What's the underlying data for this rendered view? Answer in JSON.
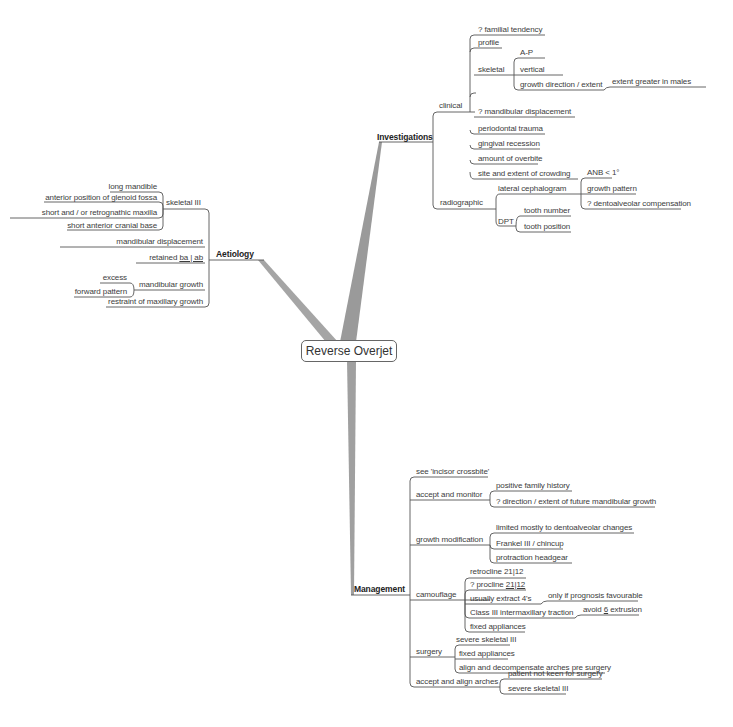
{
  "root": {
    "label": "Reverse Overjet"
  },
  "investigations": {
    "label": "Investigations",
    "clinical": {
      "label": "clinical",
      "items": [
        "? familial tendency",
        "profile",
        "skeletal",
        "? mandibular displacement",
        "periodontal trauma",
        "gingival recession",
        "amount of overbite",
        "site and extent of crowding"
      ],
      "skeletal": {
        "items": [
          "A-P",
          "vertical",
          "growth direction / extent"
        ],
        "growth_note": "extent greater in males"
      }
    },
    "radiographic": {
      "label": "radiographic",
      "lateral_ceph": {
        "label": "lateral cephalogram",
        "items": [
          "ANB < 1°",
          "growth pattern",
          "? dentoalveolar compensation"
        ]
      },
      "dpt": {
        "label": "DPT",
        "items": [
          "tooth number",
          "tooth position"
        ]
      }
    }
  },
  "aetiology": {
    "label": "Aetiology",
    "skeletal": {
      "label": "skeletal III",
      "items": [
        "long mandible",
        "anterior position of glenoid fossa",
        "short and / or retrognathic  maxilla",
        "short anterior cranial base"
      ]
    },
    "mandibular_displacement": "mandibular displacement",
    "retained": {
      "prefix": "retained ",
      "teeth": "ba | ab"
    },
    "mandibular_growth": {
      "label": "mandibular growth",
      "items": [
        "excess",
        "forward pattern"
      ]
    },
    "restraint": "restraint of  maxillary growth"
  },
  "management": {
    "label": "Management",
    "see_crossbite": "see 'incisor crossbite'",
    "accept_monitor": {
      "label": "accept and monitor",
      "items": [
        "positive family history",
        "? direction / extent of future mandibular growth"
      ]
    },
    "growth_mod": {
      "label": "growth modification",
      "items": [
        "limited mostly to dentoalveolar changes",
        "Frankel III / chincup",
        "protraction headgear"
      ]
    },
    "camouflage": {
      "label": "camouflage",
      "retrocline": "retrocline 21|12",
      "procline": {
        "prefix": "? procline ",
        "teeth": "21|12"
      },
      "extract": "usually extract 4's",
      "extract_note": "only if prognosis favourable",
      "class3": "Class III intermaxillary traction",
      "class3_note": {
        "prefix": "avoid ",
        "tooth": "6",
        "suffix": " extrusion"
      },
      "fixed": "fixed appliances"
    },
    "surgery": {
      "label": "surgery",
      "items": [
        "severe skeletal III",
        "fixed appliances",
        "align and decompensate arches pre surgery"
      ]
    },
    "accept_align": {
      "label": "accept and align arches",
      "items": [
        "patient not keen for surgery",
        "severe skeletal III"
      ]
    }
  },
  "colors": {
    "line": "#555555",
    "trunk": "#9a9a9a",
    "text": "#3c3c3c"
  }
}
